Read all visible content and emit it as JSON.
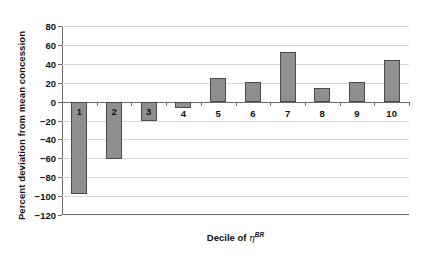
{
  "chart_data": {
    "type": "bar",
    "title": "",
    "subtitle": "",
    "xlabel": "Decile of ηBR",
    "xlabel_base": "Decile of ",
    "xlabel_symbol": "η",
    "xlabel_superscript": "BR",
    "ylabel": "Percent deviation from mean concession",
    "categories": [
      "1",
      "2",
      "3",
      "4",
      "5",
      "6",
      "7",
      "8",
      "9",
      "10"
    ],
    "values": [
      -98,
      -61,
      -21,
      -7,
      25,
      21,
      53,
      14,
      21,
      44
    ],
    "series": [
      {
        "name": "Percent deviation from mean concession",
        "values": [
          -98,
          -61,
          -21,
          -7,
          25,
          21,
          53,
          14,
          21,
          44
        ]
      }
    ],
    "ylim": [
      -120,
      80
    ],
    "yticks": [
      80,
      60,
      40,
      20,
      0,
      -20,
      -40,
      -60,
      -80,
      -100,
      -120
    ],
    "ytick_labels": [
      "80",
      "60",
      "40",
      "20",
      "0",
      "−20",
      "−40",
      "−60",
      "−80",
      "−100",
      "−120"
    ],
    "grid": true,
    "legend": false,
    "legend_position": "none",
    "bar_color": "#8f8f8f",
    "bar_edge_color": "#4a4a4a",
    "grid_color": "#d8d8d8",
    "axis_color": "#6a6a6a",
    "text_color": "#111111",
    "background": "#ffffff",
    "labels_inside_bars": [
      "1",
      "2",
      "3"
    ],
    "labels_below_axis": [
      "4",
      "5",
      "6",
      "7",
      "8",
      "9",
      "10"
    ],
    "annotations": []
  }
}
